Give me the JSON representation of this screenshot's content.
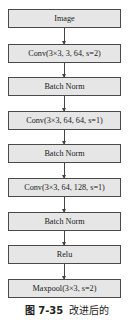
{
  "diagram": {
    "nodes": [
      {
        "id": "image",
        "label": "Image",
        "top": 9
      },
      {
        "id": "conv1",
        "label": "Conv(3×3, 3, 64, s=2)",
        "top": 44
      },
      {
        "id": "bn1",
        "label": "Batch Norm",
        "top": 77
      },
      {
        "id": "conv2",
        "label": "Conv(3×3, 64, 64, s=1)",
        "top": 111
      },
      {
        "id": "bn2",
        "label": "Batch Norm",
        "top": 144
      },
      {
        "id": "conv3",
        "label": "Conv(3×3, 64, 128, s=1)",
        "top": 178
      },
      {
        "id": "bn3",
        "label": "Batch Norm",
        "top": 212
      },
      {
        "id": "relu",
        "label": "Relu",
        "top": 245
      },
      {
        "id": "maxpool",
        "label": "Maxpool(3×3, s=2)",
        "top": 279
      }
    ],
    "edges": [
      [
        "image",
        "conv1"
      ],
      [
        "conv1",
        "bn1"
      ],
      [
        "bn1",
        "conv2"
      ],
      [
        "conv2",
        "bn2"
      ],
      [
        "bn2",
        "conv3"
      ],
      [
        "conv3",
        "bn3"
      ],
      [
        "bn3",
        "relu"
      ],
      [
        "relu",
        "maxpool"
      ]
    ]
  },
  "caption": {
    "number": "图 7-35",
    "text": "改进后的"
  },
  "colors": {
    "box_fill": "#e6e6e6",
    "box_border": "#4a4a4a",
    "arrow": "#444444"
  }
}
